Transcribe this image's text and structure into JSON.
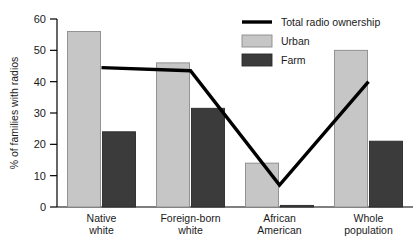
{
  "chart_data": {
    "type": "bar",
    "title": "",
    "xlabel": "",
    "ylabel": "% of families with radios",
    "ylim": [
      0,
      60
    ],
    "yticks": [
      0,
      10,
      20,
      30,
      40,
      50,
      60
    ],
    "ytick_labels": [
      "0",
      "10",
      "20",
      "30",
      "40",
      "50",
      "60"
    ],
    "grid": false,
    "legend_position": "top-right",
    "categories": [
      "Native white",
      "Foreign-born white",
      "African American",
      "Whole population"
    ],
    "category_lines": [
      [
        "Native",
        "white"
      ],
      [
        "Foreign-born",
        "white"
      ],
      [
        "African",
        "American"
      ],
      [
        "Whole",
        "population"
      ]
    ],
    "series": [
      {
        "name": "Urban",
        "type": "bar",
        "color": "#c6c6c6",
        "values": [
          56,
          46,
          14,
          50
        ]
      },
      {
        "name": "Farm",
        "type": "bar",
        "color": "#3b3b3b",
        "values": [
          24,
          31.5,
          0.5,
          21
        ]
      },
      {
        "name": "Total radio ownership",
        "type": "line",
        "color": "#000000",
        "values": [
          44.5,
          43.5,
          7,
          40
        ]
      }
    ]
  },
  "legend": {
    "entries": [
      {
        "label": "Total radio ownership",
        "marker": "line",
        "color": "#000000"
      },
      {
        "label": "Urban",
        "marker": "swatch",
        "color": "#c6c6c6"
      },
      {
        "label": "Farm",
        "marker": "swatch",
        "color": "#3b3b3b"
      }
    ]
  },
  "axis": {
    "y_title": "% of families with radios"
  },
  "colors": {
    "urban": "#c6c6c6",
    "farm": "#3b3b3b",
    "line": "#000000",
    "axis": "#000000",
    "text": "#1a1a1a",
    "background": "#ffffff"
  }
}
